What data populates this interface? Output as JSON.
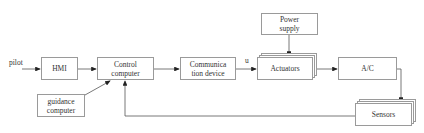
{
  "diagram": {
    "type": "block diagram",
    "input_label": "pilot",
    "signal_label": "u",
    "blocks": {
      "hmi": "HMI",
      "control_computer": "Control computer",
      "guidance_computer": "guidance computer",
      "communication_device": "Communica tion device",
      "power_supply": "Power supply",
      "actuators": "Actuators",
      "aircraft": "A/C",
      "sensors": "Sensors"
    },
    "edges": [
      [
        "pilot",
        "HMI"
      ],
      [
        "HMI",
        "Control computer"
      ],
      [
        "guidance computer",
        "Control computer"
      ],
      [
        "Control computer",
        "Communica tion device"
      ],
      [
        "Communica tion device",
        "Actuators"
      ],
      [
        "Power supply",
        "Actuators"
      ],
      [
        "Actuators",
        "A/C"
      ],
      [
        "A/C",
        "Sensors"
      ],
      [
        "Sensors",
        "Control computer"
      ]
    ],
    "colors": {
      "line": "#555555",
      "border": "#9a9a9a",
      "text": "#333333"
    }
  }
}
